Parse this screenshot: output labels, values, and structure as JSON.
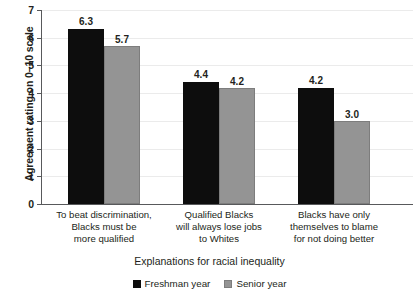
{
  "chart_data": {
    "type": "bar",
    "title": "",
    "xlabel": "Explanations for racial inequality",
    "ylabel": "Agreement rating on 0–10 scale",
    "ylim": [
      0,
      7
    ],
    "yticks": [
      0,
      1,
      2,
      3,
      4,
      5,
      6,
      7
    ],
    "ytick_labels": [
      "0",
      "1",
      "2",
      "3",
      "4",
      "5",
      "6",
      "7"
    ],
    "grid": true,
    "legend_position": "bottom-center",
    "categories": [
      "To beat discrimination,\nBlacks must be\nmore qualified",
      "Qualified Blacks\nwill always lose jobs\nto Whites",
      "Blacks have only\nthemselves to blame\nfor not doing better"
    ],
    "category_lines": [
      [
        "To beat discrimination,",
        "Blacks must be",
        "more qualified"
      ],
      [
        "Qualified Blacks",
        "will always lose jobs",
        "to Whites"
      ],
      [
        "Blacks have only",
        "themselves to blame",
        "for not doing better"
      ]
    ],
    "series": [
      {
        "name": "Freshman year",
        "color": "#0d0d0d",
        "values": [
          6.3,
          4.4,
          4.2
        ],
        "value_labels": [
          "6.3",
          "4.4",
          "4.2"
        ]
      },
      {
        "name": "Senior year",
        "color": "#949494",
        "values": [
          5.7,
          4.2,
          3.0
        ],
        "value_labels": [
          "5.7",
          "4.2",
          "3.0"
        ]
      }
    ]
  },
  "legend": {
    "items": [
      {
        "label": "Freshman year",
        "swatch": "black-square-swatch"
      },
      {
        "label": "Senior year",
        "swatch": "gray-square-swatch"
      }
    ]
  }
}
